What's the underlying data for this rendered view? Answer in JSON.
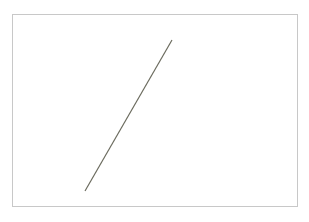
{
  "chart_data": {
    "type": "line",
    "title": "",
    "xlabel": "",
    "ylabel": "",
    "grid": false,
    "legend": null,
    "series": [
      {
        "name": "",
        "color": "#6b6b5e",
        "points_px": [
          [
            85,
            191
          ],
          [
            172,
            40
          ]
        ]
      }
    ],
    "frame": {
      "x": 12,
      "y": 14,
      "width": 286,
      "height": 193,
      "color": "#c8c8c8"
    }
  }
}
